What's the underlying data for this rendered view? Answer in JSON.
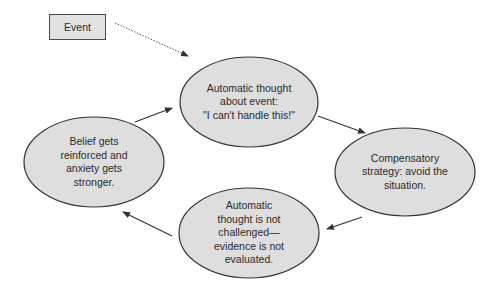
{
  "diagram": {
    "type": "cycle-flowchart",
    "colors": {
      "node_fill": "#dedede",
      "node_stroke": "#333333",
      "text": "#2a2a2a",
      "arrow": "#333333",
      "background": "#ffffff"
    },
    "start": {
      "label": "Event"
    },
    "nodes": [
      {
        "id": "automatic-thought",
        "label": "Automatic thought\nabout event:\n\"I can't handle this!\""
      },
      {
        "id": "compensatory-strategy",
        "label": "Compensatory\nstrategy: avoid the\nsituation."
      },
      {
        "id": "thought-not-challenged",
        "label": "Automatic\nthought is not\nchallenged—\nevidence is not\nevaluated."
      },
      {
        "id": "belief-reinforced",
        "label": "Belief gets\nreinforced and\nanxiety gets\nstronger."
      }
    ],
    "edges": [
      {
        "from": "Event",
        "to": "automatic-thought",
        "style": "dotted"
      },
      {
        "from": "automatic-thought",
        "to": "compensatory-strategy",
        "style": "solid"
      },
      {
        "from": "compensatory-strategy",
        "to": "thought-not-challenged",
        "style": "solid"
      },
      {
        "from": "thought-not-challenged",
        "to": "belief-reinforced",
        "style": "solid"
      },
      {
        "from": "belief-reinforced",
        "to": "automatic-thought",
        "style": "solid"
      }
    ]
  }
}
